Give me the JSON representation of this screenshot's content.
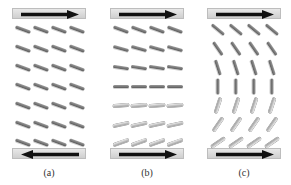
{
  "figure": {
    "panels": [
      {
        "label": "(a)",
        "top_arrow": "right",
        "bottom_arrow": "left",
        "rows": 7,
        "cols": 4,
        "row_angles_deg": [
          20,
          20,
          20,
          20,
          20,
          20,
          20
        ]
      },
      {
        "label": "(b)",
        "top_arrow": "right",
        "bottom_arrow": "right",
        "rows": 7,
        "cols": 4,
        "row_angles_deg": [
          20,
          15,
          8,
          0,
          -5,
          -12,
          -20
        ]
      },
      {
        "label": "(c)",
        "top_arrow": "right",
        "bottom_arrow": "right",
        "rows": 7,
        "cols": 4,
        "row_angles_deg": [
          40,
          55,
          72,
          90,
          108,
          125,
          145
        ]
      }
    ],
    "colors": {
      "plate": "#d9d9d9",
      "arrow": "#111111",
      "molecule": "#777777",
      "label": "#333333"
    }
  }
}
